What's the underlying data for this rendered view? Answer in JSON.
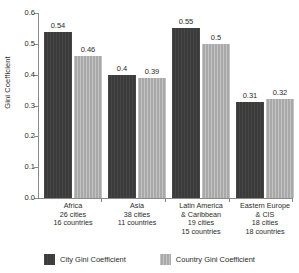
{
  "chart_data": {
    "type": "bar",
    "title": "",
    "xlabel": "",
    "ylabel": "Gini Coefficient",
    "ylim": [
      0,
      0.6
    ],
    "ytick_labels": [
      "0.0",
      "0.1",
      "0.2",
      "0.3",
      "0.4",
      "0.5",
      "0.6"
    ],
    "ytick_values": [
      0.0,
      0.1,
      0.2,
      0.3,
      0.4,
      0.5,
      0.6
    ],
    "grid": false,
    "legend_position": "bottom",
    "categories": [
      "Africa\n26 cities\n16 countries",
      "Asia\n38 cities\n11 countries",
      "Latin America\n& Caribbean\n19 cities\n15 countries",
      "Eastern Europe\n& CIS\n18 cities\n18 countries"
    ],
    "series": [
      {
        "name": "City Gini Coefficient",
        "color": "#3b3b3b",
        "values": [
          0.54,
          0.4,
          0.55,
          0.31
        ],
        "labels": [
          "0.54",
          "0.4",
          "0.55",
          "0.31"
        ]
      },
      {
        "name": "Country Gini Coefficient",
        "color": "#a9a9a9",
        "values": [
          0.46,
          0.39,
          0.5,
          0.32
        ],
        "labels": [
          "0.46",
          "0.39",
          "0.5",
          "0.32"
        ]
      }
    ]
  },
  "axis": {
    "y_title": "Gini Coefficient",
    "ticks": [
      "0.6",
      "0.5",
      "0.4",
      "0.3",
      "0.2",
      "0.1",
      "0.0"
    ]
  },
  "legend": {
    "items": [
      {
        "label": "City Gini Coefficient",
        "color": "#3b3b3b"
      },
      {
        "label": "Country Gini Coefficient",
        "color": "#a9a9a9"
      }
    ]
  },
  "groups": [
    {
      "name": "Africa",
      "lines": [
        "Africa",
        "26 cities",
        "16 countries"
      ],
      "text": "Africa\n26 cities\n16 countries",
      "city_label": "0.54",
      "country_label": "0.46"
    },
    {
      "name": "Asia",
      "lines": [
        "Asia",
        "38 cities",
        "11 countries"
      ],
      "text": "Asia\n38 cities\n11 countries",
      "city_label": "0.4",
      "country_label": "0.39"
    },
    {
      "name": "Latin America & Caribbean",
      "lines": [
        "Latin America",
        "& Caribbean",
        "19 cities",
        "15 countries"
      ],
      "text": "Latin America\n& Caribbean\n19 cities\n15 countries",
      "city_label": "0.55",
      "country_label": "0.5"
    },
    {
      "name": "Eastern Europe & CIS",
      "lines": [
        "Eastern Europe",
        "& CIS",
        "18 cities",
        "18 countries"
      ],
      "text": "Eastern Europe\n& CIS\n18 cities\n18 countries",
      "city_label": "0.31",
      "country_label": "0.32"
    }
  ]
}
